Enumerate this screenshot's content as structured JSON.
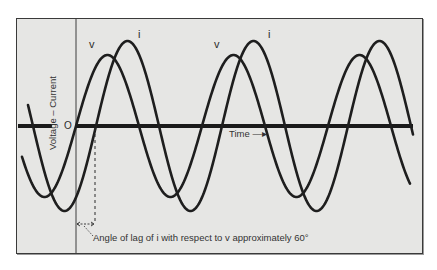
{
  "figure": {
    "axis_label": "Voltage – Current",
    "origin_label": "O",
    "time_label": "Time —▸",
    "curve_labels": [
      {
        "text": "v",
        "x": 89,
        "y": 48
      },
      {
        "text": "i",
        "x": 138,
        "y": 38
      },
      {
        "text": "v",
        "x": 214,
        "y": 48
      },
      {
        "text": "i",
        "x": 268,
        "y": 38
      }
    ],
    "annotation": "Angle of lag of i with respect to v approximately 60°",
    "colors": {
      "background": "#e6e6e4",
      "curve": "#1e1e1e",
      "axis": "#1a1a1a",
      "frame": "#3a3a3a"
    }
  },
  "chart_data": {
    "type": "line",
    "title": "",
    "xlabel": "Time",
    "ylabel": "Voltage – Current",
    "grid": false,
    "legend": "inline labels (v, i)",
    "series": [
      {
        "name": "v",
        "shape": "sine",
        "amplitude_rel": 0.83,
        "phase_deg": 0,
        "period_px": 126,
        "zero_up_x": [
          76,
          202,
          329
        ],
        "peaks_x": [
          107,
          233,
          358
        ]
      },
      {
        "name": "i",
        "shape": "sine",
        "amplitude_rel": 1.0,
        "phase_deg": -60,
        "period_px": 126,
        "zero_up_x": [
          95,
          221,
          347
        ],
        "peaks_x": [
          127,
          254,
          378
        ]
      }
    ],
    "phase_lag_deg": 60,
    "annotations": [
      "Angle of lag of i with respect to v approximately 60°"
    ]
  },
  "geometry": {
    "axis_y": 126,
    "v_amp": 71,
    "i_amp": 85,
    "period": 126,
    "v_zero": 76,
    "i_zero": 96,
    "x_start": 22,
    "x_end": 413,
    "vertical_axis_x": 76,
    "dashed_x": 95
  }
}
